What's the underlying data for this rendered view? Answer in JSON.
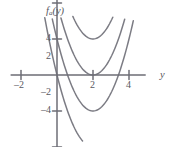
{
  "chart_data": {
    "type": "line",
    "title": "",
    "subtitle": "",
    "xlabel": "y",
    "ylabel": "f_a(y)",
    "ylabel_base": "f",
    "ylabel_sub": "a",
    "ylabel_arg": "(y)",
    "xlim": [
      -2.55,
      4.9
    ],
    "ylim": [
      -5.3,
      5.1
    ],
    "grid": false,
    "legend": null,
    "legend_position": "none",
    "xticks": [
      -2,
      2,
      4
    ],
    "xtick_labels": [
      "–2",
      "2",
      "4"
    ],
    "yticks": [
      4,
      2,
      -2,
      -4
    ],
    "ytick_labels": [
      "4",
      "2",
      "–2",
      "–4"
    ],
    "curve_color": "#7c7c84",
    "axis_color": "#6e6e76",
    "background": "#ffffff",
    "vertex_x": 2,
    "curvature": 1.0,
    "series": [
      {
        "name": "a = 4",
        "vertex": [
          2,
          4
        ],
        "values_at": {
          "x": [
            -2.4,
            -1,
            0,
            1,
            2,
            3,
            4,
            4.8
          ],
          "y": [
            23.4,
            13.0,
            8.0,
            5.0,
            4.0,
            5.0,
            8.0,
            11.8
          ]
        }
      },
      {
        "name": "a = 2",
        "vertex": [
          2,
          2
        ],
        "values_at": {
          "x": [
            -2.4,
            -1,
            0,
            1,
            2,
            3,
            4,
            4.8
          ],
          "y": [
            21.4,
            11.0,
            6.0,
            3.0,
            2.0,
            3.0,
            6.0,
            9.8
          ]
        }
      },
      {
        "name": "a = 0",
        "vertex": [
          2,
          0
        ],
        "values_at": {
          "x": [
            -2.4,
            -1,
            0,
            1,
            2,
            3,
            4,
            4.8
          ],
          "y": [
            19.4,
            9.0,
            4.0,
            1.0,
            0.0,
            1.0,
            4.0,
            7.8
          ]
        }
      },
      {
        "name": "a = -2",
        "vertex": [
          2,
          -2
        ],
        "values_at": {
          "x": [
            -2.4,
            -1,
            0,
            1,
            2,
            3,
            4,
            4.8
          ],
          "y": [
            17.4,
            7.0,
            2.0,
            -1.0,
            -2.0,
            -1.0,
            2.0,
            5.8
          ]
        }
      },
      {
        "name": "a = -4",
        "vertex": [
          2,
          -4
        ],
        "values_at": {
          "x": [
            -2.4,
            -1,
            0,
            1,
            2,
            3,
            4,
            4.8
          ],
          "y": [
            15.4,
            5.0,
            0.0,
            -3.0,
            -4.0,
            -3.0,
            0.0,
            3.8
          ]
        }
      }
    ],
    "annotations": []
  }
}
